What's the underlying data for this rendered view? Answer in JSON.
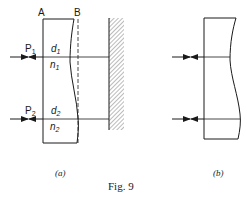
{
  "figure": {
    "caption": "Fig. 9",
    "stroke_color": "#1a1a1a",
    "background": "#ffffff"
  },
  "panel_a": {
    "label": "(a)",
    "surface_labels": {
      "front": "A",
      "back": "B"
    },
    "points": [
      {
        "name": "P",
        "sub": "1",
        "d": "d",
        "d_sub": "1",
        "n": "n",
        "n_sub": "1"
      },
      {
        "name": "P",
        "sub": "2",
        "d": "d",
        "d_sub": "2",
        "n": "n",
        "n_sub": "2"
      }
    ]
  },
  "panel_b": {
    "label": "(b)"
  }
}
